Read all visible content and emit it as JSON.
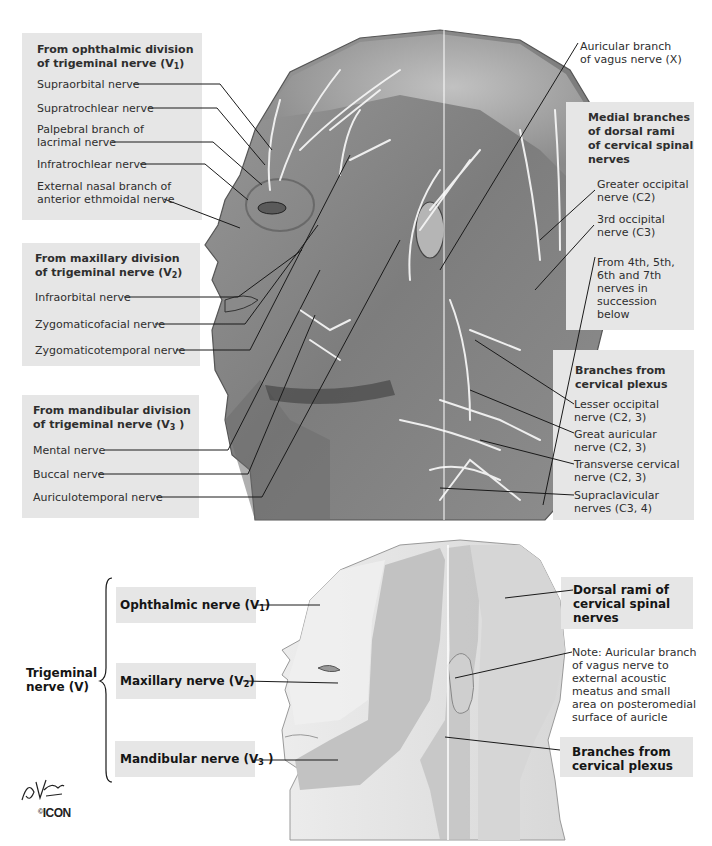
{
  "upper": {
    "ophthalmic": {
      "heading_1": "From ophthalmic division",
      "heading_2": "of trigeminal nerve (V",
      "heading_sub": "1",
      "heading_close": ")",
      "items": [
        "Supraorbital nerve",
        "Supratrochlear nerve",
        "Palpebral branch of",
        "lacrimal nerve",
        "Infratrochlear nerve",
        "External nasal branch of",
        "anterior ethmoidal nerve"
      ]
    },
    "maxillary": {
      "heading_1": "From maxillary division",
      "heading_2": "of trigeminal nerve (V",
      "heading_sub": "2",
      "heading_close": ")",
      "items": [
        "Infraorbital nerve",
        "Zygomaticofacial nerve",
        "Zygomaticotemporal nerve"
      ]
    },
    "mandibular": {
      "heading_1": "From mandibular division",
      "heading_2": "of trigeminal nerve (V",
      "heading_sub": "3",
      "heading_close": " )",
      "items": [
        "Mental nerve",
        "Buccal nerve",
        "Auriculotemporal nerve"
      ]
    },
    "vagus": {
      "line_1": "Auricular branch",
      "line_2": "of vagus nerve (X)"
    },
    "dorsal_rami": {
      "heading": [
        "Medial branches",
        "of dorsal rami",
        "of cervical spinal",
        "nerves"
      ],
      "items": [
        [
          "Greater occipital",
          "nerve (C2)"
        ],
        [
          "3rd occipital",
          "nerve (C3)"
        ],
        [
          "From 4th, 5th,",
          "6th and 7th",
          "nerves in",
          "succession",
          "below"
        ]
      ]
    },
    "cervical_plexus": {
      "heading": [
        "Branches from",
        "cervical plexus"
      ],
      "items": [
        [
          "Lesser occipital",
          "nerve (C2, 3)"
        ],
        [
          "Great auricular",
          "nerve (C2, 3)"
        ],
        [
          "Transverse cervical",
          "nerve (C2, 3)"
        ],
        [
          "Supraclavicular",
          "nerves (C3, 4)"
        ]
      ]
    }
  },
  "lower": {
    "trigeminal": [
      "Trigeminal",
      "nerve (V)"
    ],
    "branches": [
      {
        "label": "Ophthalmic nerve (V",
        "sub": "1",
        "close": ")"
      },
      {
        "label": "Maxillary nerve (V",
        "sub": "2",
        "close": ")"
      },
      {
        "label": "Mandibular nerve (V",
        "sub": "3",
        "close": " )"
      }
    ],
    "dorsal_rami": [
      "Dorsal rami of",
      "cervical spinal",
      "nerves"
    ],
    "note": [
      "Note: Auricular branch",
      "of vagus nerve to",
      "external acoustic",
      "meatus and small",
      "area on posteromedial",
      "surface of auricle"
    ],
    "cervical_plexus": [
      "Branches from",
      "cervical plexus"
    ]
  },
  "signature": {
    "name": "F. Netter M.D.",
    "publisher": "ICON"
  },
  "colors": {
    "label_box": "#e6e6e6",
    "text": "#2e2e2e",
    "heading": "#151515",
    "skin_light": "#e2e2e2",
    "skin_dark": "#bdbdbd"
  }
}
